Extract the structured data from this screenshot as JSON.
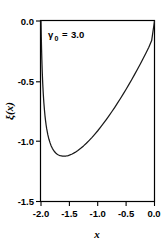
{
  "chart_data": {
    "type": "line",
    "title": "",
    "subtitle": "",
    "xlabel": "x",
    "ylabel": "ξ(x)",
    "xlim": [
      -2.0,
      0.0
    ],
    "ylim": [
      -1.5,
      0.0
    ],
    "grid": false,
    "legend": null,
    "annotations": [
      {
        "name": "gamma-zero-annotation",
        "symbol": "γ",
        "subscript": "0",
        "relation": "=",
        "value": "3.0",
        "text": "γ₀ = 3.0",
        "x": -1.72,
        "y": -0.13
      }
    ],
    "xticks": [
      -2.0,
      -1.5,
      -1.0,
      -0.5,
      0.0
    ],
    "xticklabels": [
      "-2.0",
      "-1.5",
      "-1.0",
      "-0.5",
      "0.0"
    ],
    "yticks": [
      0.0,
      -0.5,
      -1.0,
      -1.5
    ],
    "yticklabels": [
      "0.0",
      "-0.5",
      "-1.0",
      "-1.5"
    ],
    "tick_direction": "out",
    "series": [
      {
        "name": "xi-of-x",
        "color": "#1a1a1a",
        "x": [
          -2.0,
          -1.995,
          -1.99,
          -1.985,
          -1.98,
          -1.975,
          -1.97,
          -1.96,
          -1.95,
          -1.94,
          -1.93,
          -1.92,
          -1.91,
          -1.9,
          -1.88,
          -1.86,
          -1.84,
          -1.82,
          -1.8,
          -1.78,
          -1.76,
          -1.74,
          -1.72,
          -1.7,
          -1.68,
          -1.66,
          -1.64,
          -1.62,
          -1.6,
          -1.58,
          -1.56,
          -1.54,
          -1.52,
          -1.5,
          -1.45,
          -1.4,
          -1.35,
          -1.3,
          -1.25,
          -1.2,
          -1.15,
          -1.1,
          -1.05,
          -1.0,
          -0.95,
          -0.9,
          -0.85,
          -0.8,
          -0.75,
          -0.7,
          -0.65,
          -0.6,
          -0.55,
          -0.5,
          -0.45,
          -0.4,
          -0.35,
          -0.3,
          -0.25,
          -0.2,
          -0.15,
          -0.1,
          -0.05,
          0.0
        ],
        "y": [
          0.0,
          -0.13,
          -0.235,
          -0.32,
          -0.395,
          -0.46,
          -0.515,
          -0.605,
          -0.677,
          -0.736,
          -0.786,
          -0.828,
          -0.864,
          -0.895,
          -0.945,
          -0.983,
          -1.013,
          -1.038,
          -1.058,
          -1.074,
          -1.087,
          -1.097,
          -1.105,
          -1.111,
          -1.116,
          -1.119,
          -1.121,
          -1.123,
          -1.123,
          -1.123,
          -1.122,
          -1.12,
          -1.118,
          -1.115,
          -1.105,
          -1.092,
          -1.076,
          -1.058,
          -1.038,
          -1.016,
          -0.992,
          -0.967,
          -0.94,
          -0.912,
          -0.882,
          -0.851,
          -0.819,
          -0.786,
          -0.752,
          -0.717,
          -0.681,
          -0.644,
          -0.606,
          -0.567,
          -0.527,
          -0.486,
          -0.444,
          -0.401,
          -0.357,
          -0.312,
          -0.266,
          -0.218,
          -0.163,
          0.0
        ]
      }
    ],
    "minimum": {
      "x": -1.59,
      "y": -1.123
    },
    "endpoints": [
      {
        "x": -2.0,
        "y": 0.0
      },
      {
        "x": 0.0,
        "y": 0.0
      }
    ]
  },
  "figure": {
    "background_color": "#ffffff",
    "frame_color": "#000000",
    "name": "xi-vs-x-plot"
  }
}
